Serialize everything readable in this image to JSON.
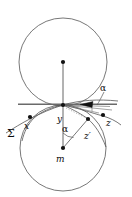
{
  "figure": {
    "background_color": "#ffffff",
    "stroke_color": "#4a4a4a",
    "label_color": "#0a0a0a",
    "width": 132,
    "height": 197
  },
  "labels": {
    "x": "x",
    "y": "y",
    "z": "z",
    "z_prime": "z′",
    "m": "m",
    "sigma": "Σ",
    "alpha_top": "α",
    "alpha_bottom": "α"
  },
  "points": [
    {
      "name": "upper-circle-center",
      "label": "",
      "x": 63,
      "y": 62
    },
    {
      "name": "tangency-point-y",
      "label": "y",
      "x": 63,
      "y": 105
    },
    {
      "name": "point-x",
      "label": "x",
      "x": 30,
      "y": 117
    },
    {
      "name": "point-z",
      "label": "z",
      "x": 103,
      "y": 115
    },
    {
      "name": "point-z-prime",
      "label": "z′",
      "x": 88,
      "y": 119
    },
    {
      "name": "lower-circle-center-m",
      "label": "m",
      "x": 63,
      "y": 148
    }
  ],
  "shapes": {
    "upper_circle": {
      "cx": 63,
      "cy": 62,
      "r": 44
    },
    "lower_circle": {
      "cx": 63,
      "cy": 148,
      "r": 43
    },
    "tangent_line": {
      "x1": 18,
      "y1": 104,
      "x2": 116,
      "y2": 104
    },
    "radius_upper": {
      "x1": 63,
      "y1": 62,
      "x2": 63,
      "y2": 105
    },
    "radius_lower": {
      "x1": 63,
      "y1": 148,
      "x2": 63,
      "y2": 105
    },
    "chord_m_to_zprime": {
      "x1": 63,
      "y1": 148,
      "x2": 88,
      "y2": 119
    }
  }
}
